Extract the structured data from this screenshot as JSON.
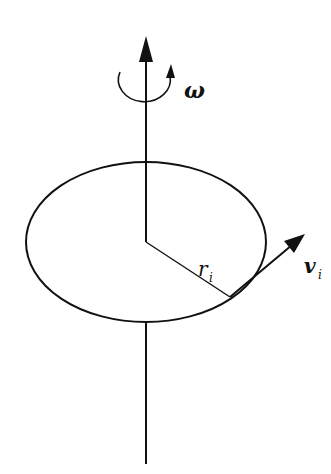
{
  "diagram": {
    "labels": {
      "omega": "ω",
      "radius": "r",
      "radius_sub": "i",
      "velocity": "v",
      "velocity_sub": "i"
    },
    "colors": {
      "stroke": "#111111",
      "background": "#ffffff"
    }
  }
}
